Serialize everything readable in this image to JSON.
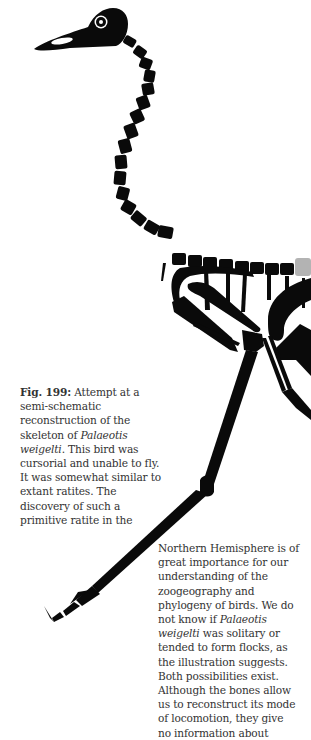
{
  "figure": {
    "colors": {
      "bone": "#0a0a0a",
      "missing_bone": "#b3b3b3",
      "background": "#ffffff",
      "text": "#333333"
    }
  },
  "caption": {
    "label": "Fig. 199:",
    "lines": [
      " Attempt at a",
      "semi-schematic",
      "reconstruction of the",
      "skeleton of ",
      "weigelti",
      ". This bird was",
      "cursorial and unable to fly.",
      "It was somewhat similar to",
      "extant ratites. The",
      "discovery of such a",
      "primitive ratite in the"
    ],
    "italic_1": "Palaeotis"
  },
  "body_text": {
    "lines": [
      "Northern Hemisphere is of",
      "great importance for our",
      "understanding of the",
      "zoogeography and",
      "phylogeny of birds. We do",
      "not know if ",
      "Palaeotis",
      "weigelti",
      " was solitary or",
      "tended to form flocks, as",
      "the illustration suggests.",
      "Both possibilities exist.",
      "Although the bones allow",
      "us to reconstruct its mode",
      "of locomotion, they give",
      "no information about"
    ]
  }
}
